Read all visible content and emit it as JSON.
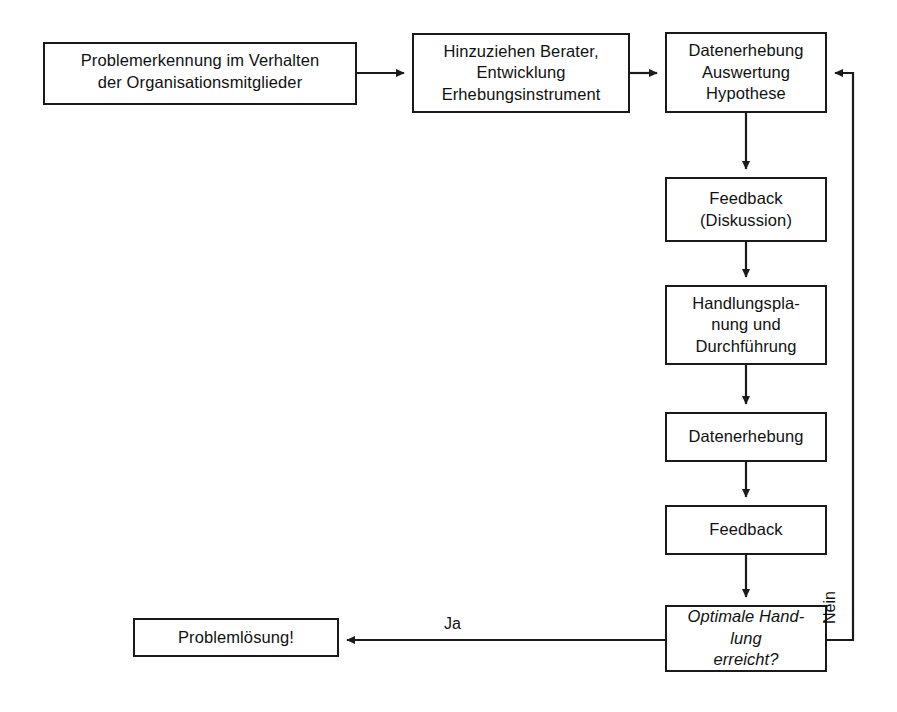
{
  "diagram": {
    "stroke_color": "#1a1a1a",
    "background_color": "#ffffff",
    "nodes": [
      {
        "id": "problemerkennung",
        "label": "Problemerkennung im Verhalten\nder Organisationsmitglieder",
        "x": 43,
        "y": 42,
        "w": 314,
        "h": 63,
        "style": "process"
      },
      {
        "id": "berater",
        "label": "Hinzuziehen Berater,\nEntwicklung\nErhebungsinstrument",
        "x": 412,
        "y": 33,
        "w": 218,
        "h": 80,
        "style": "process"
      },
      {
        "id": "datenerhebung-auswertung",
        "label": "Datenerhebung\nAuswertung\nHypothese",
        "x": 665,
        "y": 32,
        "w": 162,
        "h": 81,
        "style": "process"
      },
      {
        "id": "feedback-diskussion",
        "label": "Feedback\n(Diskussion)",
        "x": 665,
        "y": 177,
        "w": 162,
        "h": 65,
        "style": "process"
      },
      {
        "id": "handlungsplanung",
        "label": "Handlungspla-\nnung und\nDurchführung",
        "x": 665,
        "y": 285,
        "w": 162,
        "h": 80,
        "style": "process"
      },
      {
        "id": "datenerhebung",
        "label": "Datenerhebung",
        "x": 665,
        "y": 412,
        "w": 162,
        "h": 50,
        "style": "process"
      },
      {
        "id": "feedback",
        "label": "Feedback",
        "x": 665,
        "y": 505,
        "w": 162,
        "h": 50,
        "style": "process"
      },
      {
        "id": "optimale-handlung",
        "label": "Optimale Hand-\nlung\nerreicht?",
        "x": 665,
        "y": 605,
        "w": 162,
        "h": 67,
        "style": "decision"
      },
      {
        "id": "problemloesung",
        "label": "Problemlösung!",
        "x": 133,
        "y": 618,
        "w": 206,
        "h": 39,
        "style": "terminal"
      }
    ],
    "edges": [
      {
        "id": "e1",
        "from": "problemerkennung",
        "to": "berater",
        "label": ""
      },
      {
        "id": "e2",
        "from": "berater",
        "to": "datenerhebung-auswertung",
        "label": ""
      },
      {
        "id": "e3",
        "from": "datenerhebung-auswertung",
        "to": "feedback-diskussion",
        "label": ""
      },
      {
        "id": "e4",
        "from": "feedback-diskussion",
        "to": "handlungsplanung",
        "label": ""
      },
      {
        "id": "e5",
        "from": "handlungsplanung",
        "to": "datenerhebung",
        "label": ""
      },
      {
        "id": "e6",
        "from": "datenerhebung",
        "to": "feedback",
        "label": ""
      },
      {
        "id": "e7",
        "from": "feedback",
        "to": "optimale-handlung",
        "label": ""
      },
      {
        "id": "e8",
        "from": "optimale-handlung",
        "to": "problemloesung",
        "label": "Ja"
      },
      {
        "id": "e9",
        "from": "optimale-handlung",
        "to": "datenerhebung-auswertung",
        "label": "Nein"
      }
    ],
    "labels": {
      "ja": "Ja",
      "nein": "Nein"
    }
  }
}
